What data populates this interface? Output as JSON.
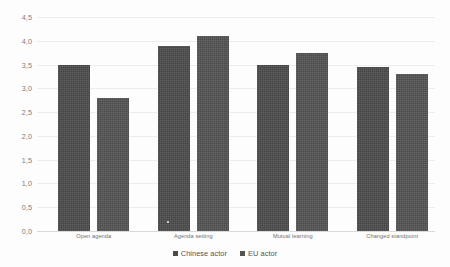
{
  "chart_data": {
    "type": "bar",
    "title": "",
    "subtitle": "",
    "xlabel": "",
    "ylabel": "",
    "ylim": [
      0,
      4.5
    ],
    "ytick_step": 0.5,
    "ytick_labels": [
      "0,0",
      "0,5",
      "1,0",
      "1,5",
      "2,0",
      "2,5",
      "3,0",
      "3,5",
      "4,0",
      "4,5"
    ],
    "ytick_values": [
      0,
      0.5,
      1,
      1.5,
      2,
      2.5,
      3,
      3.5,
      4,
      4.5
    ],
    "decimal_separator": ",",
    "grid": true,
    "grid_axis": "y",
    "legend_position": "bottom",
    "categories": [
      "Open agenda",
      "Agenda setting",
      "Mutual learning",
      "Changed standpoint"
    ],
    "series": [
      {
        "name": "Chinese actor",
        "color": "#4b4b4b",
        "values": [
          3.5,
          3.9,
          3.5,
          3.45
        ]
      },
      {
        "name": "EU actor",
        "color": "#535353",
        "values": [
          2.8,
          4.1,
          3.75,
          3.3
        ]
      }
    ],
    "annotations": []
  },
  "legend": {
    "entries": [
      {
        "label": "Chinese actor",
        "marker": "square-marker"
      },
      {
        "label": "EU actor",
        "marker": "square-marker"
      }
    ]
  },
  "colors": {
    "series_chinese_actor": "#4b4b4b",
    "series_eu_actor": "#535353",
    "gridline": "#ededed",
    "baseline": "#d9d9d9",
    "tick_label": "#7b7b7b",
    "category_label": "#6f6f6f",
    "legend_label": "#555555",
    "background": "#fdfdfd"
  }
}
